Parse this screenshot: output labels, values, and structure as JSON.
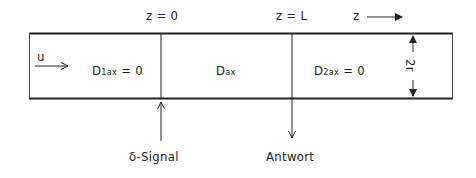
{
  "labels": {
    "z0": "z = 0",
    "zL": "z = L",
    "z_axis": "z",
    "velocity": "u",
    "section1": {
      "main": "D",
      "sub": "1ax",
      "rest": " = 0"
    },
    "section2": {
      "main": "D",
      "sub": "ax",
      "rest": ""
    },
    "section3": {
      "main": "D",
      "sub": "2ax",
      "rest": " = 0"
    },
    "diameter": "2r",
    "input": "δ-Signal",
    "output": "Antwort"
  },
  "colors": {
    "line": "#222222",
    "background": "#ffffff"
  }
}
